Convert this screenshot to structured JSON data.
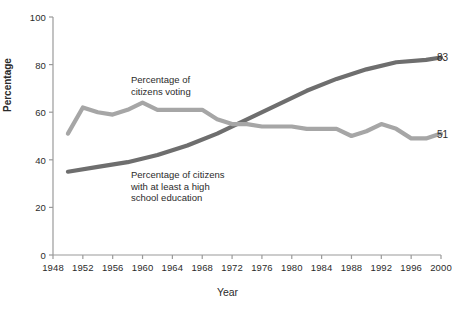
{
  "chart_data": {
    "type": "line",
    "title": "",
    "xlabel": "Year",
    "ylabel": "Percentage",
    "xlim": [
      1948,
      2000
    ],
    "ylim": [
      0,
      100
    ],
    "grid": false,
    "legend_position": "inline-annotations",
    "yticks": [
      0,
      20,
      40,
      60,
      80,
      100
    ],
    "ytick_labels": [
      "0",
      "20",
      "40",
      "60",
      "80",
      "100"
    ],
    "xticks": [
      1948,
      1952,
      1956,
      1960,
      1964,
      1968,
      1972,
      1976,
      1980,
      1984,
      1988,
      1992,
      1996,
      2000
    ],
    "xtick_labels": [
      "1948",
      "1952",
      "1956",
      "1960",
      "1964",
      "1968",
      "1972",
      "1976",
      "1980",
      "1984",
      "1988",
      "1992",
      "1996",
      "2000"
    ],
    "series": [
      {
        "name": "Percentage of citizens voting",
        "color": "#a6a6a6",
        "x": [
          1950,
          1952,
          1954,
          1956,
          1958,
          1960,
          1962,
          1964,
          1966,
          1968,
          1970,
          1972,
          1974,
          1976,
          1978,
          1980,
          1982,
          1984,
          1986,
          1988,
          1990,
          1992,
          1994,
          1996,
          1998,
          2000
        ],
        "values": [
          51,
          62,
          60,
          59,
          61,
          64,
          61,
          61,
          61,
          61,
          57,
          55,
          55,
          54,
          54,
          54,
          53,
          53,
          53,
          50,
          52,
          55,
          53,
          49,
          49,
          51
        ],
        "end_label": "51"
      },
      {
        "name": "Percentage of citizens with at least a high school education",
        "color": "#6e6e6e",
        "x": [
          1950,
          1954,
          1958,
          1962,
          1966,
          1970,
          1974,
          1978,
          1982,
          1986,
          1990,
          1994,
          1998,
          2000
        ],
        "values": [
          35,
          37,
          39,
          42,
          46,
          51,
          57,
          63,
          69,
          74,
          78,
          81,
          82,
          83
        ],
        "end_label": "83"
      }
    ],
    "annotations": [
      {
        "id": "voting",
        "text": "Percentage of\ncitizens voting"
      },
      {
        "id": "education",
        "text": "Percentage of citizens\nwith at least a high\nschool education"
      }
    ]
  },
  "colors": {
    "axis": "#9a9a9a",
    "text": "#2b2b2b",
    "voting_line": "#a6a6a6",
    "education_line": "#6e6e6e",
    "background": "#ffffff"
  }
}
